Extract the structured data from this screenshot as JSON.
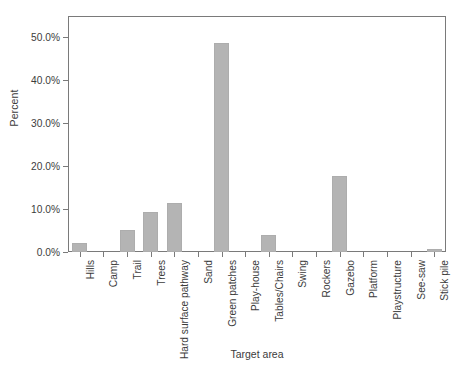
{
  "chart_data": {
    "type": "bar",
    "title": "",
    "subtitle": "",
    "xlabel": "Target area",
    "ylabel": "Percent",
    "categories": [
      "Hills",
      "Camp",
      "Trail",
      "Trees",
      "Hard surface pathway",
      "Sand",
      "Green patches",
      "Play-house",
      "Tables/Chairs",
      "Swing",
      "Rockers",
      "Gazebo",
      "Platform",
      "Playstructure",
      "See-saw",
      "Stick pile"
    ],
    "values": [
      2.0,
      0.0,
      5.1,
      9.3,
      11.5,
      0.0,
      48.8,
      0.0,
      3.9,
      0.0,
      0.0,
      17.6,
      0.0,
      0.0,
      0.0,
      0.8
    ],
    "ylim": [
      0,
      55
    ],
    "yticks": [
      0,
      10,
      20,
      30,
      40,
      50
    ],
    "ytick_labels": [
      "0.0%",
      "10.0%",
      "20.0%",
      "30.0%",
      "40.0%",
      "50.0%"
    ],
    "grid": false,
    "legend": "none",
    "bar_color": "#b4b4b4",
    "axis_color": "#7a7a7a",
    "text_color": "#3c3c3c"
  }
}
